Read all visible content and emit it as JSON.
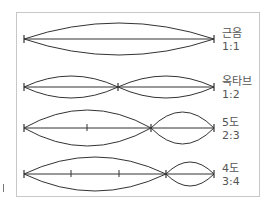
{
  "rows": [
    {
      "name": "근음",
      "ratio": "1:1",
      "y": 39,
      "x0": 24,
      "x1": 214,
      "nodes": [],
      "ticks": [],
      "segments": [
        {
          "a": 24,
          "b": 214,
          "amp": 16
        }
      ]
    },
    {
      "name": "옥타브",
      "ratio": "1:2",
      "y": 87,
      "x0": 24,
      "x1": 214,
      "nodes": [
        118
      ],
      "ticks": [],
      "segments": [
        {
          "a": 24,
          "b": 118,
          "amp": 11
        },
        {
          "a": 118,
          "b": 214,
          "amp": 11
        }
      ]
    },
    {
      "name": "5도",
      "ratio": "2:3",
      "y": 128,
      "x0": 24,
      "x1": 214,
      "nodes": [
        151
      ],
      "ticks": [
        87
      ],
      "segments": [
        {
          "a": 24,
          "b": 151,
          "amp": 18
        },
        {
          "a": 151,
          "b": 214,
          "amp": 16
        }
      ]
    },
    {
      "name": "4도",
      "ratio": "3:4",
      "y": 174,
      "x0": 24,
      "x1": 214,
      "nodes": [
        166
      ],
      "ticks": [
        71,
        119
      ],
      "segments": [
        {
          "a": 24,
          "b": 166,
          "amp": 17
        },
        {
          "a": 166,
          "b": 214,
          "amp": 12
        }
      ]
    }
  ],
  "colors": {
    "line": "#333333",
    "frame": "#c8c8c8",
    "text": "#555555"
  }
}
